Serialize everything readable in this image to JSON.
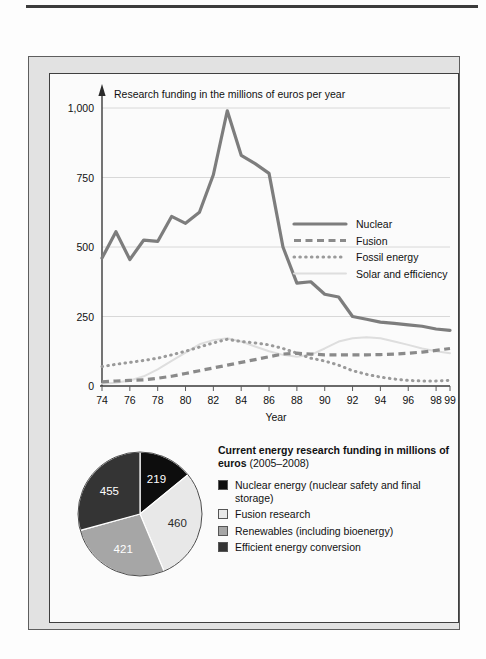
{
  "figure": {
    "line_chart": {
      "note": "Research funding in the millions of euros per year",
      "xlabel": "Year",
      "y_ticks": [
        "0",
        "250",
        "500",
        "750",
        "1,000"
      ],
      "x_ticks": [
        "74",
        "76",
        "78",
        "80",
        "82",
        "84",
        "86",
        "88",
        "90",
        "92",
        "94",
        "96",
        "98",
        "99"
      ],
      "legend": [
        {
          "label": "Nuclear",
          "style": "solid",
          "color": "#7d7d7d"
        },
        {
          "label": "Fusion",
          "style": "dashed",
          "color": "#8a8a8a"
        },
        {
          "label": "Fossil energy",
          "style": "dotted",
          "color": "#9a9a9a"
        },
        {
          "label": "Solar and efficiency",
          "style": "thin-solid",
          "color": "#dcdcdc"
        }
      ]
    },
    "pie_chart": {
      "title_bold": "Current energy research funding in millions of euros",
      "title_range": "(2005–2008)",
      "slices": [
        {
          "value": "219",
          "label": "Nuclear energy (nuclear safety and final storage)",
          "color": "#0d0d0d",
          "text_color": "#ffffff"
        },
        {
          "value": "460",
          "label": "Fusion research",
          "color": "#e8e8e8",
          "text_color": "#2a2a2a"
        },
        {
          "value": "421",
          "label": "Renewables (including bioenergy)",
          "color": "#a6a6a6",
          "text_color": "#ffffff"
        },
        {
          "value": "455",
          "label": "Efficient energy conversion",
          "color": "#343434",
          "text_color": "#ffffff"
        }
      ]
    }
  },
  "chart_data": [
    {
      "type": "line",
      "title": "Research funding in the millions of euros per year",
      "xlabel": "Year",
      "ylabel": "",
      "xlim": [
        1974,
        1999
      ],
      "ylim": [
        0,
        1000
      ],
      "ytick_values": [
        0,
        250,
        500,
        750,
        1000
      ],
      "ytick_labels": [
        "0",
        "250",
        "500",
        "750",
        "1,000"
      ],
      "xtick_values": [
        1974,
        1976,
        1978,
        1980,
        1982,
        1984,
        1986,
        1988,
        1990,
        1992,
        1994,
        1996,
        1998,
        1999
      ],
      "xtick_labels": [
        "74",
        "76",
        "78",
        "80",
        "82",
        "84",
        "86",
        "88",
        "90",
        "92",
        "94",
        "96",
        "98",
        "99"
      ],
      "grid": "horizontal",
      "legend_position": "inside-right",
      "x": [
        1974,
        1975,
        1976,
        1977,
        1978,
        1979,
        1980,
        1981,
        1982,
        1983,
        1984,
        1985,
        1986,
        1987,
        1988,
        1989,
        1990,
        1991,
        1992,
        1993,
        1994,
        1995,
        1996,
        1997,
        1998,
        1999
      ],
      "series": [
        {
          "name": "Nuclear",
          "style": "solid",
          "values": [
            460,
            555,
            455,
            525,
            520,
            610,
            585,
            625,
            760,
            990,
            830,
            800,
            765,
            500,
            370,
            375,
            330,
            320,
            250,
            240,
            230,
            225,
            220,
            215,
            205,
            200
          ]
        },
        {
          "name": "Fusion",
          "style": "dashed",
          "values": [
            15,
            18,
            20,
            22,
            28,
            35,
            45,
            55,
            65,
            75,
            85,
            95,
            105,
            115,
            118,
            115,
            112,
            112,
            112,
            112,
            113,
            115,
            118,
            122,
            128,
            135
          ]
        },
        {
          "name": "Fossil energy",
          "style": "dotted",
          "values": [
            70,
            78,
            85,
            92,
            100,
            112,
            125,
            140,
            155,
            168,
            160,
            155,
            148,
            135,
            118,
            100,
            90,
            75,
            55,
            42,
            32,
            25,
            20,
            18,
            18,
            20
          ]
        },
        {
          "name": "Solar and efficiency",
          "style": "thin-solid",
          "values": [
            8,
            12,
            20,
            35,
            60,
            90,
            120,
            150,
            165,
            172,
            160,
            142,
            125,
            112,
            105,
            112,
            135,
            160,
            172,
            175,
            172,
            160,
            148,
            135,
            125,
            118
          ]
        }
      ]
    },
    {
      "type": "pie",
      "title": "Current energy research funding in millions of euros (2005–2008)",
      "labels": [
        "Nuclear energy (nuclear safety and final storage)",
        "Fusion research",
        "Renewables (including bioenergy)",
        "Efficient energy conversion"
      ],
      "values": [
        219,
        460,
        421,
        455
      ],
      "colors": [
        "#0d0d0d",
        "#e8e8e8",
        "#a6a6a6",
        "#343434"
      ],
      "start_angle": 90,
      "direction": "clockwise",
      "total": 1555
    }
  ]
}
